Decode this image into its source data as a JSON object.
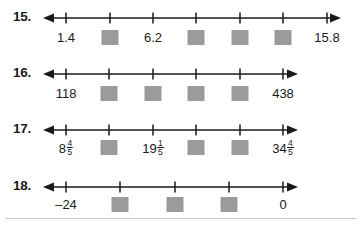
{
  "worksheet": {
    "title": "Number line fill-in-the-blank exercises 15-18",
    "accent_color": "#9b9b9b",
    "line_color": "#1a1a1a",
    "rule_color": "#c8c8c8",
    "missing_box_label": "blank"
  },
  "problems": [
    {
      "number": "15.",
      "tick_count": 7,
      "marks": [
        {
          "type": "label",
          "text": "1.4"
        },
        {
          "type": "blank",
          "text": ""
        },
        {
          "type": "label",
          "text": "6.2"
        },
        {
          "type": "blank",
          "text": ""
        },
        {
          "type": "blank",
          "text": ""
        },
        {
          "type": "blank",
          "text": ""
        },
        {
          "type": "label",
          "text": "15.8"
        }
      ]
    },
    {
      "number": "16.",
      "tick_count": 6,
      "marks": [
        {
          "type": "label",
          "text": "118"
        },
        {
          "type": "blank",
          "text": ""
        },
        {
          "type": "blank",
          "text": ""
        },
        {
          "type": "blank",
          "text": ""
        },
        {
          "type": "blank",
          "text": ""
        },
        {
          "type": "label",
          "text": "438"
        }
      ]
    },
    {
      "number": "17.",
      "tick_count": 6,
      "marks": [
        {
          "type": "mixed",
          "whole": "8",
          "numerator": "4",
          "denominator": "5",
          "text": "8 4/5"
        },
        {
          "type": "blank",
          "text": ""
        },
        {
          "type": "mixed",
          "whole": "19",
          "numerator": "1",
          "denominator": "5",
          "text": "19 1/5"
        },
        {
          "type": "blank",
          "text": ""
        },
        {
          "type": "blank",
          "text": ""
        },
        {
          "type": "mixed",
          "whole": "34",
          "numerator": "4",
          "denominator": "5",
          "text": "34 4/5"
        }
      ]
    },
    {
      "number": "18.",
      "tick_count": 5,
      "marks": [
        {
          "type": "label",
          "text": "–24"
        },
        {
          "type": "blank",
          "text": ""
        },
        {
          "type": "blank",
          "text": ""
        },
        {
          "type": "blank",
          "text": ""
        },
        {
          "type": "label",
          "text": "0"
        }
      ]
    }
  ],
  "layout": {
    "rows": [
      {
        "top": 8,
        "number_top": 10,
        "label_top": 31,
        "tick_x": [
          66,
          110,
          153,
          196,
          240,
          283,
          327
        ],
        "line_start": 44,
        "line_end": 340
      },
      {
        "top": 64,
        "number_top": 66,
        "label_top": 87,
        "tick_x": [
          66,
          109,
          153,
          196,
          240,
          283
        ],
        "line_start": 44,
        "line_end": 297
      },
      {
        "top": 120,
        "number_top": 122,
        "label_top": 141,
        "tick_x": [
          66,
          109,
          153,
          196,
          240,
          283
        ],
        "line_start": 44,
        "line_end": 297
      },
      {
        "top": 177,
        "number_top": 179,
        "label_top": 198,
        "tick_x": [
          66,
          120,
          175,
          229,
          283
        ],
        "line_start": 44,
        "line_end": 297
      }
    ]
  }
}
